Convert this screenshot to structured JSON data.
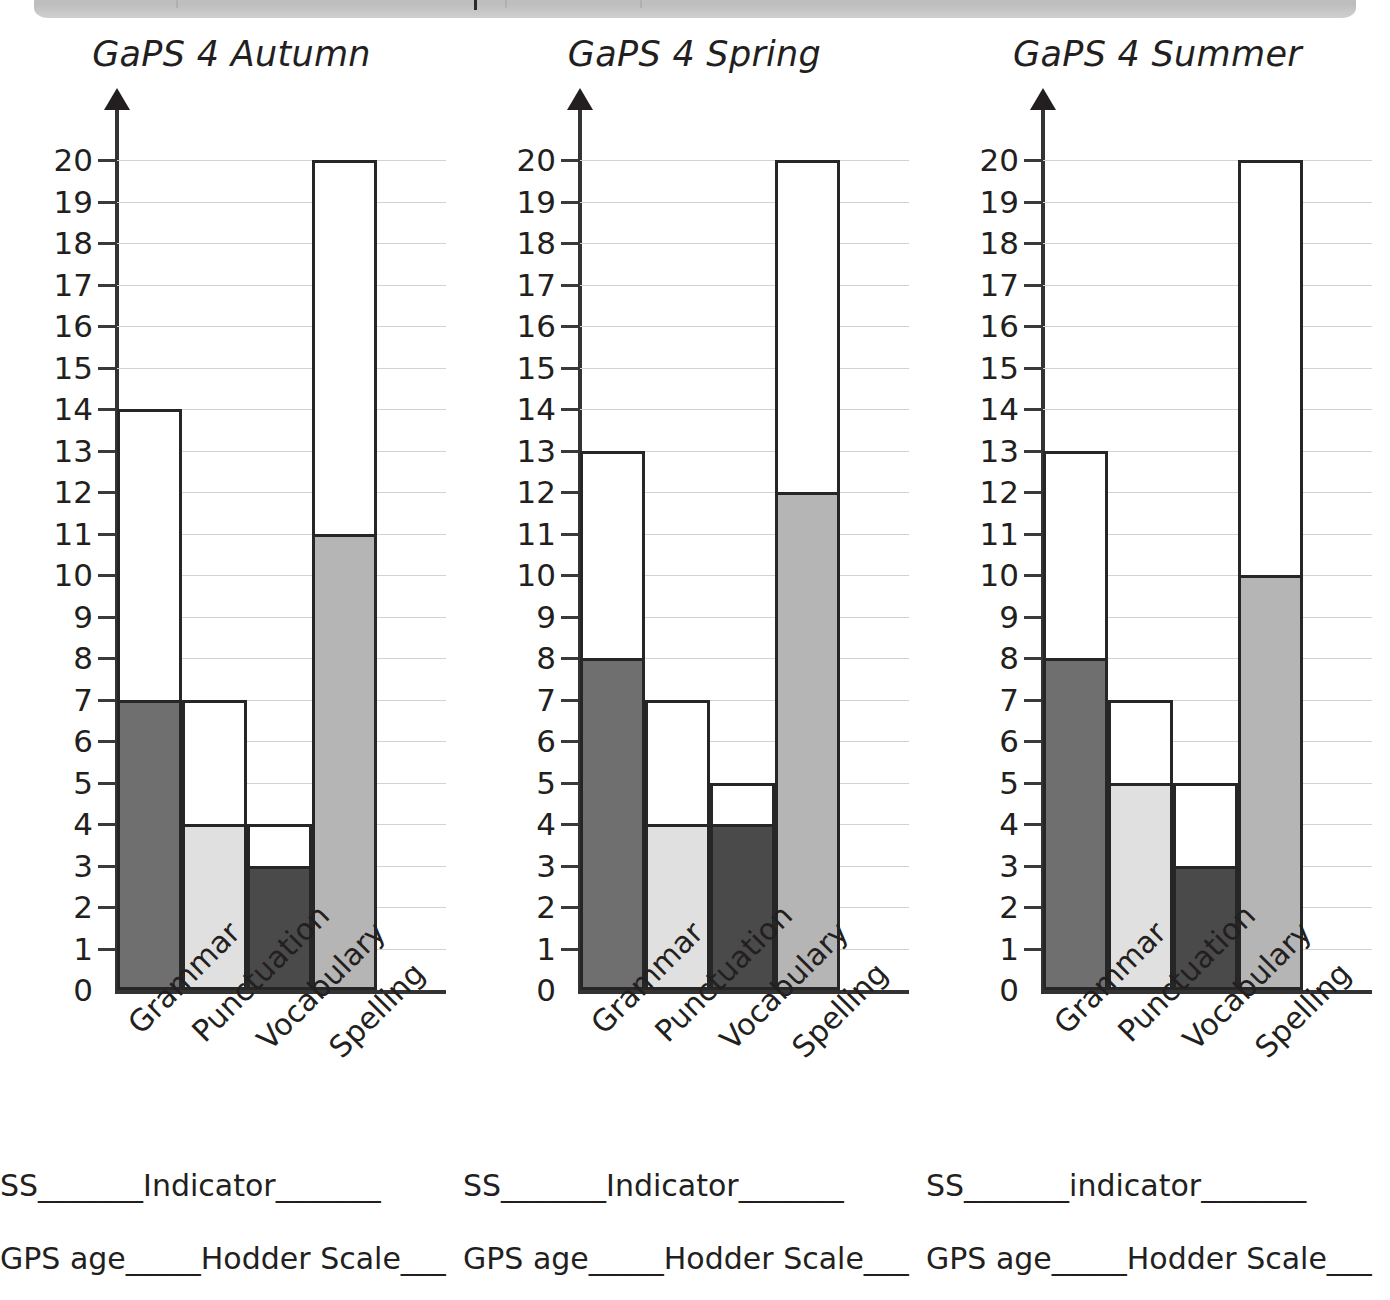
{
  "banner": {
    "present": true,
    "color": "#c4c4c4",
    "separator_color": "#2b2b2b"
  },
  "axis": {
    "ymin": 0,
    "ymax": 20,
    "ticks": [
      20,
      19,
      18,
      17,
      16,
      15,
      14,
      13,
      12,
      11,
      10,
      9,
      8,
      7,
      6,
      5,
      4,
      3,
      2,
      1,
      0
    ]
  },
  "palette": {
    "grammar_fill": "#6f6f6f",
    "punctuation_fill": "#e0e0e0",
    "vocabulary_fill": "#4a4a4a",
    "spelling_fill": "#b5b5b5",
    "outline": "#262626",
    "gridline": "#d2d2d2",
    "text": "#231f20"
  },
  "chart_data": [
    {
      "type": "bar",
      "title": "GaPS 4 Autumn",
      "categories": [
        "Grammar",
        "Punctuation",
        "Vocabulary",
        "Spelling"
      ],
      "series": [
        {
          "name": "Total (outline)",
          "values": [
            14,
            7,
            4,
            20
          ]
        },
        {
          "name": "Score (filled)",
          "values": [
            7,
            4,
            3,
            11
          ]
        }
      ],
      "xlabel": "",
      "ylabel": "",
      "ylim": [
        0,
        20
      ],
      "grid": true,
      "legend": "none"
    },
    {
      "type": "bar",
      "title": "GaPS 4 Spring",
      "categories": [
        "Grammar",
        "Punctuation",
        "Vocabulary",
        "Spelling"
      ],
      "series": [
        {
          "name": "Total (outline)",
          "values": [
            13,
            7,
            5,
            20
          ]
        },
        {
          "name": "Score (filled)",
          "values": [
            8,
            4,
            4,
            12
          ]
        }
      ],
      "xlabel": "",
      "ylabel": "",
      "ylim": [
        0,
        20
      ],
      "grid": true,
      "legend": "none"
    },
    {
      "type": "bar",
      "title": "GaPS 4 Summer",
      "categories": [
        "Grammar",
        "Punctuation",
        "Vocabulary",
        "Spelling"
      ],
      "series": [
        {
          "name": "Total (outline)",
          "values": [
            13,
            7,
            5,
            20
          ]
        },
        {
          "name": "Score (filled)",
          "values": [
            8,
            5,
            3,
            10
          ]
        }
      ],
      "xlabel": "",
      "ylabel": "",
      "ylim": [
        0,
        20
      ],
      "grid": true,
      "legend": "none"
    }
  ],
  "panels": [
    {
      "title": "GaPS 4 Autumn",
      "footer_line1": "SS_______Indicator_______",
      "footer_line2": "GPS age_____Hodder Scale___"
    },
    {
      "title": "GaPS 4 Spring",
      "footer_line1": "SS_______Indicator_______",
      "footer_line2": "GPS age_____Hodder Scale___"
    },
    {
      "title": "GaPS 4 Summer",
      "footer_line1": "SS_______indicator_______",
      "footer_line2": "GPS age_____Hodder Scale___"
    }
  ]
}
